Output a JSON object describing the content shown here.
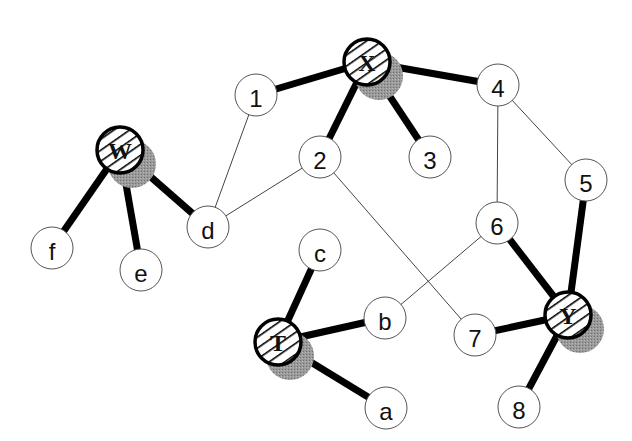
{
  "diagram": {
    "type": "graph",
    "hub_nodes": [
      {
        "id": "W",
        "label": "W",
        "x": 120,
        "y": 150,
        "r": 25
      },
      {
        "id": "X",
        "label": "X",
        "x": 367,
        "y": 62,
        "r": 25
      },
      {
        "id": "T",
        "label": "T",
        "x": 278,
        "y": 342,
        "r": 25
      },
      {
        "id": "Y",
        "label": "Y",
        "x": 568,
        "y": 315,
        "r": 25
      }
    ],
    "nodes": [
      {
        "id": "1",
        "label": "1",
        "x": 256,
        "y": 95
      },
      {
        "id": "2",
        "label": "2",
        "x": 320,
        "y": 157
      },
      {
        "id": "3",
        "label": "3",
        "x": 430,
        "y": 157
      },
      {
        "id": "4",
        "label": "4",
        "x": 498,
        "y": 85
      },
      {
        "id": "5",
        "label": "5",
        "x": 586,
        "y": 180
      },
      {
        "id": "6",
        "label": "6",
        "x": 497,
        "y": 223
      },
      {
        "id": "7",
        "label": "7",
        "x": 475,
        "y": 335
      },
      {
        "id": "8",
        "label": "8",
        "x": 519,
        "y": 407
      },
      {
        "id": "d",
        "label": "d",
        "x": 208,
        "y": 227
      },
      {
        "id": "f",
        "label": "f",
        "x": 52,
        "y": 248
      },
      {
        "id": "e",
        "label": "e",
        "x": 141,
        "y": 270
      },
      {
        "id": "c",
        "label": "c",
        "x": 320,
        "y": 250
      },
      {
        "id": "b",
        "label": "b",
        "x": 385,
        "y": 318
      },
      {
        "id": "a",
        "label": "a",
        "x": 386,
        "y": 408
      }
    ],
    "thick_edges": [
      [
        "W",
        "f"
      ],
      [
        "W",
        "e"
      ],
      [
        "W",
        "d"
      ],
      [
        "X",
        "1"
      ],
      [
        "X",
        "2"
      ],
      [
        "X",
        "3"
      ],
      [
        "X",
        "4"
      ],
      [
        "T",
        "c"
      ],
      [
        "T",
        "b"
      ],
      [
        "T",
        "a"
      ],
      [
        "Y",
        "5"
      ],
      [
        "Y",
        "6"
      ],
      [
        "Y",
        "7"
      ],
      [
        "Y",
        "8"
      ]
    ],
    "thin_edges": [
      [
        "1",
        "d"
      ],
      [
        "2",
        "d"
      ],
      [
        "2",
        "7"
      ],
      [
        "4",
        "6"
      ],
      [
        "4",
        "5"
      ],
      [
        "6",
        "b"
      ]
    ],
    "colors": {
      "line": "#000000",
      "node_fill": "#ffffff",
      "node_stroke": "#555555",
      "shadow": "#8a8a8a"
    }
  }
}
